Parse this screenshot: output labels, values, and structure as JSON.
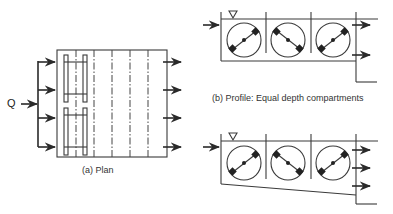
{
  "figure": {
    "plan": {
      "caption": "(a) Plan",
      "inlet_label": "Q",
      "inlet_arrows": 4,
      "outlet_arrows": 4,
      "dashed_dividers": 6,
      "paddle_frames": 2
    },
    "profile_equal": {
      "caption": "(b) Profile: Equal depth compartments",
      "compartments": 3,
      "outlet_arrows": 2,
      "water_level_symbol": "▽"
    },
    "profile_tapered": {
      "caption": "",
      "compartments": 3,
      "outlet_arrows": 3,
      "water_level_symbol": "▽"
    },
    "colors": {
      "line": "#3a3a3a",
      "background": "#ffffff"
    }
  }
}
